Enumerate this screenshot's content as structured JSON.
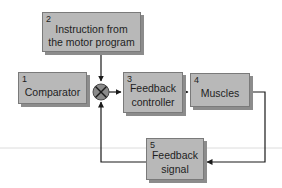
{
  "diagram": {
    "title": "",
    "colors": {
      "box_fill": "#b8b8b8",
      "box_border": "#7a7a7a",
      "line": "#1a1a1a",
      "comparator_fill": "#8a8a8a",
      "divider": "#dcdcdc"
    },
    "nodes": [
      {
        "id": "instruction",
        "number": "2",
        "label_line1": "Instruction from",
        "label_line2": "the motor program"
      },
      {
        "id": "comparator",
        "number": "1",
        "label_line1": "Comparator",
        "label_line2": ""
      },
      {
        "id": "feedback-controller",
        "number": "3",
        "label_line1": "Feedback",
        "label_line2": "controller"
      },
      {
        "id": "muscles",
        "number": "4",
        "label_line1": "Muscles",
        "label_line2": ""
      },
      {
        "id": "feedback-signal",
        "number": "5",
        "label_line1": "Feedback",
        "label_line2": "signal"
      }
    ],
    "junction": {
      "id": "comparator-summing-junction",
      "symbol": "cross-circle-icon"
    },
    "edges": [
      {
        "from": "instruction",
        "to": "comparator-summing-junction"
      },
      {
        "from": "comparator-summing-junction",
        "to": "feedback-controller"
      },
      {
        "from": "feedback-controller",
        "to": "muscles"
      },
      {
        "from": "muscles",
        "to": "feedback-signal"
      },
      {
        "from": "feedback-signal",
        "to": "comparator-summing-junction"
      }
    ]
  }
}
